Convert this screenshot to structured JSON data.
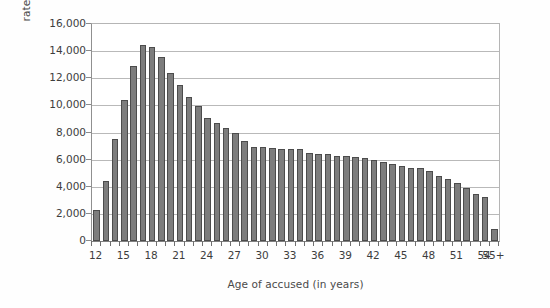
{
  "chart_data": {
    "type": "bar",
    "title": "",
    "xlabel": "Age of accused (in years)",
    "ylabel": "rate per 100,000 population",
    "ylim": [
      0,
      16000
    ],
    "grid": true,
    "legend": null,
    "y_ticks": [
      16000,
      14000,
      12000,
      10000,
      8000,
      6000,
      4000,
      2000,
      0
    ],
    "y_tick_labels": [
      "16,000",
      "14,000",
      "12,000",
      "10,000",
      "8,000",
      "6,000",
      "4,000",
      "2,000",
      "0"
    ],
    "x_tick_labels": [
      "12",
      "15",
      "18",
      "21",
      "24",
      "27",
      "30",
      "33",
      "36",
      "39",
      "42",
      "45",
      "48",
      "51",
      "54",
      "55+"
    ],
    "categories": [
      "12",
      "13",
      "14",
      "15",
      "16",
      "17",
      "18",
      "19",
      "20",
      "21",
      "22",
      "23",
      "24",
      "25",
      "26",
      "27",
      "28",
      "29",
      "30",
      "31",
      "32",
      "33",
      "34",
      "35",
      "36",
      "37",
      "38",
      "39",
      "40",
      "41",
      "42",
      "43",
      "44",
      "45",
      "46",
      "47",
      "48",
      "49",
      "50",
      "51",
      "52",
      "53",
      "54",
      "55+"
    ],
    "values": [
      2250,
      4450,
      7500,
      10400,
      12900,
      14450,
      14300,
      13600,
      12400,
      11500,
      10600,
      9950,
      9100,
      8700,
      8350,
      7950,
      7400,
      6900,
      6900,
      6850,
      6800,
      6750,
      6750,
      6500,
      6400,
      6400,
      6250,
      6250,
      6200,
      6100,
      5950,
      5800,
      5700,
      5550,
      5400,
      5400,
      5150,
      4800,
      4600,
      4250,
      3900,
      3500,
      3250,
      850
    ],
    "bar_color": "#7d7d7d",
    "bar_edge_color": "#4c4c4c",
    "gridline_color": "#b9b9b9",
    "background_color": "#ffffff"
  },
  "axes": {
    "y_title": "rate per 100,000 population",
    "x_title": "Age of accused (in years)"
  }
}
